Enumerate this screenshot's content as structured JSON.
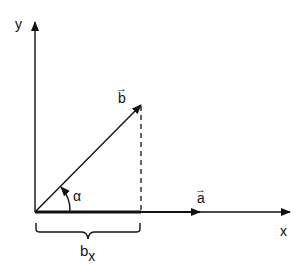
{
  "diagram": {
    "axes": {
      "x_label": "x",
      "y_label": "y"
    },
    "vectors": {
      "a": {
        "label": "a",
        "arrow_glyph": "→"
      },
      "b": {
        "label": "b",
        "arrow_glyph": "→"
      }
    },
    "angle_label": "α",
    "projection": {
      "label_main": "b",
      "label_sub": "x"
    },
    "colors": {
      "stroke": "#111111",
      "background": "#ffffff"
    }
  }
}
